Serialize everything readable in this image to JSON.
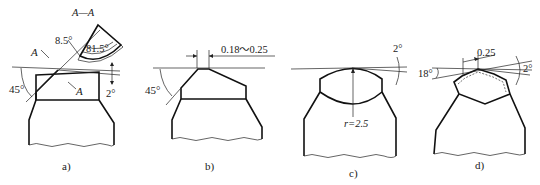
{
  "figure": {
    "panels": [
      {
        "id": "a",
        "caption": "a)",
        "section_label": "A—A",
        "cut_mark_1": "A",
        "cut_mark_2": "A",
        "angles": {
          "chamfer": "45°",
          "rake_small": "8.5°",
          "wedge": "81.5°",
          "clearance": "2°"
        }
      },
      {
        "id": "b",
        "caption": "b)",
        "land_width": "0.18～0.25",
        "angles": {
          "chamfer": "45°"
        }
      },
      {
        "id": "c",
        "caption": "c)",
        "radius": "r=2.5",
        "angles": {
          "clearance": "2°"
        }
      },
      {
        "id": "d",
        "caption": "d)",
        "land_width": "0.25",
        "angles": {
          "side": "18°",
          "clearance": "2°"
        }
      }
    ]
  }
}
